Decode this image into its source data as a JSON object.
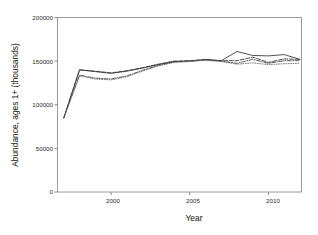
{
  "chart_data": {
    "type": "line",
    "title": "",
    "xlabel": "Year",
    "ylabel": "Abundance, ages 1+ (thousands)",
    "xlim": [
      1996.6,
      2012.1
    ],
    "ylim": [
      0,
      200000
    ],
    "xticks": [
      2000,
      2005,
      2010
    ],
    "xtick_labels": [
      "2000",
      "2005",
      "2010"
    ],
    "yticks": [
      0,
      50000,
      100000,
      150000,
      200000
    ],
    "ytick_labels": [
      "0",
      "50000",
      "100000",
      "150000",
      "200000"
    ],
    "grid": false,
    "legend": "none",
    "x": [
      1997,
      1998,
      1999,
      2000,
      2001,
      2002,
      2003,
      2004,
      2005,
      2006,
      2007,
      2008,
      2009,
      2010,
      2011,
      2012
    ],
    "series": [
      {
        "name": "series-solid",
        "style": "solid",
        "color": "#303030",
        "values": [
          85000,
          140000,
          138000,
          136000,
          138500,
          142000,
          146000,
          149500,
          150000,
          151500,
          150500,
          161000,
          156500,
          156000,
          157500,
          152000
        ]
      },
      {
        "name": "series-dashed",
        "style": "dashed",
        "color": "#303030",
        "values": [
          85000,
          140000,
          138500,
          136500,
          139000,
          142500,
          146500,
          150000,
          150500,
          152000,
          150500,
          150500,
          154500,
          148500,
          152500,
          152000
        ]
      },
      {
        "name": "series-dashdot",
        "style": "dashdot",
        "color": "#404040",
        "values": [
          85000,
          134000,
          130500,
          129500,
          133000,
          139500,
          145000,
          149000,
          150000,
          151500,
          150000,
          147500,
          152000,
          147500,
          150500,
          150500
        ]
      },
      {
        "name": "series-dotted",
        "style": "dotted",
        "color": "#6e6e6e",
        "values": [
          85000,
          133000,
          129500,
          128500,
          132000,
          138500,
          144500,
          148500,
          149500,
          151000,
          149500,
          146500,
          148000,
          146000,
          147000,
          147500
        ]
      }
    ]
  },
  "axes": {
    "frame_color": "#9a9a9a",
    "tick_color": "#8a8a8a"
  },
  "labels": {
    "y_axis_title": "Abundance, ages 1+ (thousands)",
    "x_axis_title": "Year",
    "ytick_0": "0",
    "ytick_1": "50000",
    "ytick_2": "100000",
    "ytick_3": "150000",
    "ytick_4": "200000",
    "xtick_0": "2000",
    "xtick_1": "2005",
    "xtick_2": "2010"
  }
}
